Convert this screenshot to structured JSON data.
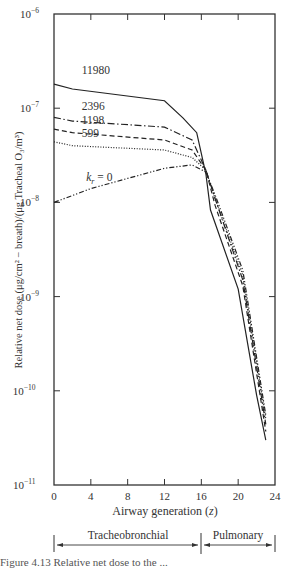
{
  "chart_data": {
    "type": "line",
    "title": "",
    "xlabel": "Airway generation (z)",
    "ylabel": "Relative net dose (μg/cm² − breath)/(μg Tracheal O₃/m³)",
    "xlim": [
      0,
      24
    ],
    "ylim": [
      1e-11,
      1e-06
    ],
    "yscale": "log",
    "x_ticks": [
      0,
      4,
      8,
      12,
      16,
      20,
      24
    ],
    "y_ticks": [
      {
        "value": 1e-06,
        "label": "10",
        "exp": "−6"
      },
      {
        "value": 1e-07,
        "label": "10",
        "exp": "−7"
      },
      {
        "value": 1e-08,
        "label": "10",
        "exp": "−8"
      },
      {
        "value": 1e-09,
        "label": "10",
        "exp": "−9"
      },
      {
        "value": 1e-10,
        "label": "10",
        "exp": "−10"
      },
      {
        "value": 1e-11,
        "label": "10",
        "exp": "−11"
      }
    ],
    "grid": false,
    "legend": "inline labels",
    "series": [
      {
        "name": "11980",
        "style": "solid",
        "x": [
          0,
          2,
          12,
          14,
          15.5,
          16.5,
          17,
          20,
          22,
          23
        ],
        "values": [
          1.8e-07,
          1.6e-07,
          1.2e-07,
          7.9e-08,
          5.5e-08,
          2e-08,
          8.3e-09,
          1.2e-09,
          9e-11,
          3e-11
        ]
      },
      {
        "name": "2396",
        "style": "dash-dot",
        "x": [
          0,
          2,
          12,
          15,
          16.5,
          17.5,
          20.5,
          23
        ],
        "values": [
          8e-08,
          7.3e-08,
          6.3e-08,
          4.6e-08,
          2.2e-08,
          1.1e-08,
          1.5e-09,
          4.4e-11
        ]
      },
      {
        "name": "1198",
        "style": "dashed",
        "x": [
          0,
          2,
          12,
          15,
          16.5,
          17.5,
          20.5,
          23
        ],
        "values": [
          6e-08,
          5.5e-08,
          4.6e-08,
          3.6e-08,
          2.2e-08,
          9.3e-09,
          1.3e-09,
          3.7e-11
        ]
      },
      {
        "name": "599",
        "style": "dotted",
        "x": [
          0,
          2,
          12,
          15,
          16.5,
          17.5,
          20.5,
          23
        ],
        "values": [
          4.4e-08,
          4e-08,
          3.6e-08,
          3e-08,
          2.2e-08,
          1.1e-08,
          1.7e-09,
          5e-11
        ]
      },
      {
        "name": "k_r = 0",
        "style": "dash-dot-dot",
        "x": [
          0,
          4,
          8,
          12,
          15,
          16.5,
          17.5,
          20.5,
          23
        ],
        "values": [
          1e-08,
          1.4e-08,
          1.8e-08,
          2.3e-08,
          2.5e-08,
          2.1e-08,
          1.2e-08,
          1.9e-09,
          5.5e-11
        ]
      }
    ],
    "annotations": [
      {
        "text": "11980",
        "x": 3,
        "value": 2.3e-07
      },
      {
        "text": "2396",
        "x": 3,
        "value": 9.5e-08
      },
      {
        "text": "1198",
        "x": 3,
        "value": 6.8e-08
      },
      {
        "text": "599",
        "x": 3,
        "value": 5e-08
      },
      {
        "text": "k_r = 0",
        "x": 3.5,
        "value": 1.7e-08
      }
    ],
    "regions": [
      {
        "label": "Tracheobronchial",
        "from": 0,
        "to": 16
      },
      {
        "label": "Pulmonary",
        "from": 16,
        "to": 24
      }
    ]
  },
  "labels": {
    "xlabel_text": "Airway generation (",
    "xlabel_var": "z",
    "xlabel_close": ")",
    "ylabel_text": "Relative net dose (μg/cm² − breath)/(μg Tracheal O₃/m³)",
    "region_tb": "Tracheobronchial",
    "region_pul": "Pulmonary",
    "kr_label_k": "k",
    "kr_label_sub": "r",
    "kr_label_rest": " = 0"
  },
  "caption": "Figure 4.13  Relative net dose to the ..."
}
